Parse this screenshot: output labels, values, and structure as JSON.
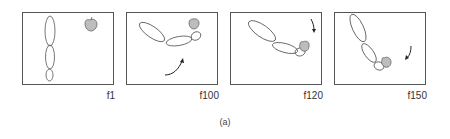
{
  "figure": {
    "caption": "(a)",
    "frames": [
      {
        "label": "f1",
        "description": "arm hanging vertically, apple at top right"
      },
      {
        "label": "f100",
        "description": "arm raised reaching apple, curved arrow pointing up-right"
      },
      {
        "label": "f120",
        "description": "arm grasping apple, arrow pointing down"
      },
      {
        "label": "f150",
        "description": "arm lowering apple, arrow pointing down-left"
      }
    ]
  },
  "colors": {
    "stroke": "#555555",
    "apple_fill": "#bdbdbd",
    "frame_border": "#555555"
  }
}
